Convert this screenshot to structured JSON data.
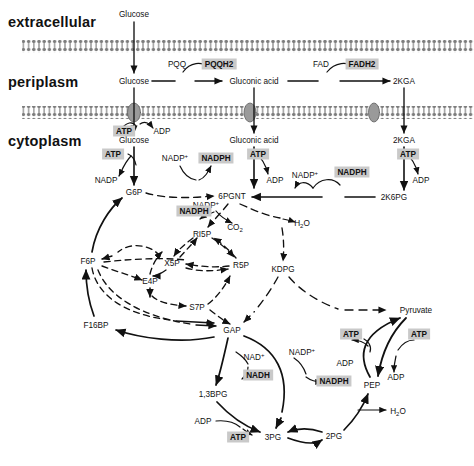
{
  "figure": {
    "type": "biochemical-pathway-diagram",
    "colors": {
      "background": "#ffffff",
      "ink": "#111111",
      "highlight_box": "#c9c9c9",
      "membrane": "#8a8a8a",
      "transporter": "#9a9a9a"
    }
  },
  "compartments": [
    {
      "id": "extracellular",
      "label": "extracellular",
      "x": 8,
      "y": 22
    },
    {
      "id": "periplasm",
      "label": "periplasm",
      "x": 8,
      "y": 82
    },
    {
      "id": "cytoplasm",
      "label": "cytoplasm",
      "x": 8,
      "y": 141
    }
  ],
  "membranes": [
    {
      "id": "outer-membrane",
      "y": 46,
      "label": "outer membrane"
    },
    {
      "id": "inner-membrane",
      "y": 112,
      "label": "inner membrane"
    }
  ],
  "transporters": [
    {
      "id": "glucose-transporter",
      "x": 134,
      "y": 112
    },
    {
      "id": "gluconic-acid-transporter",
      "x": 250,
      "y": 112
    },
    {
      "id": "2kga-transporter",
      "x": 374,
      "y": 112
    }
  ],
  "metabolites": [
    {
      "id": "glucose-extracellular",
      "label": "Glucose",
      "x": 134,
      "y": 14
    },
    {
      "id": "glucose-periplasm",
      "label": "Glucose",
      "x": 134,
      "y": 81
    },
    {
      "id": "gluconic-acid-peri",
      "label": "Gluconic acid",
      "x": 254,
      "y": 81
    },
    {
      "id": "2kga-periplasm",
      "label": "2KGA",
      "x": 404,
      "y": 81
    },
    {
      "id": "glucose-cytoplasm",
      "label": "Glucose",
      "x": 134,
      "y": 140
    },
    {
      "id": "gluconic-acid-cyto",
      "label": "Gluconic acid",
      "x": 254,
      "y": 140
    },
    {
      "id": "2kga-cytoplasm",
      "label": "2KGA",
      "x": 404,
      "y": 140
    },
    {
      "id": "g6p",
      "label": "G6P",
      "x": 134,
      "y": 192
    },
    {
      "id": "6pgnt",
      "label": "6PGNT",
      "x": 232,
      "y": 196
    },
    {
      "id": "2k6pg",
      "label": "2K6PG",
      "x": 394,
      "y": 197
    },
    {
      "id": "co2",
      "label": "CO2",
      "x": 235,
      "y": 228,
      "formula": true
    },
    {
      "id": "h2o-ed",
      "label": "H2O",
      "x": 302,
      "y": 224,
      "formula": true
    },
    {
      "id": "ri5p",
      "label": "RI5P",
      "x": 202,
      "y": 234
    },
    {
      "id": "kdpg",
      "label": "KDPG",
      "x": 283,
      "y": 269
    },
    {
      "id": "f6p",
      "label": "F6P",
      "x": 88,
      "y": 261
    },
    {
      "id": "x5p",
      "label": "X5P",
      "x": 172,
      "y": 263
    },
    {
      "id": "r5p",
      "label": "R5P",
      "x": 241,
      "y": 265
    },
    {
      "id": "e4p",
      "label": "E4P",
      "x": 150,
      "y": 281
    },
    {
      "id": "s7p",
      "label": "S7P",
      "x": 197,
      "y": 307
    },
    {
      "id": "f16bp",
      "label": "F16BP",
      "x": 96,
      "y": 325
    },
    {
      "id": "gap",
      "label": "GAP",
      "x": 232,
      "y": 330
    },
    {
      "id": "pyruvate",
      "label": "Pyruvate",
      "x": 416,
      "y": 310
    },
    {
      "id": "pep",
      "label": "PEP",
      "x": 372,
      "y": 385
    },
    {
      "id": "13bpg",
      "label": "1,3BPG",
      "x": 213,
      "y": 394
    },
    {
      "id": "3pg",
      "label": "3PG",
      "x": 273,
      "y": 437
    },
    {
      "id": "2pg",
      "label": "2PG",
      "x": 334,
      "y": 436
    },
    {
      "id": "h2o-eno",
      "label": "H2O",
      "x": 398,
      "y": 412,
      "formula": true
    }
  ],
  "cofactors_plain": [
    {
      "id": "pqq",
      "label": "PQQ",
      "x": 177,
      "y": 64
    },
    {
      "id": "fad",
      "label": "FAD",
      "x": 321,
      "y": 64
    },
    {
      "id": "adp-glk-pe",
      "label": "ADP",
      "x": 162,
      "y": 131
    },
    {
      "id": "nadp-g6pdh",
      "label": "NADP",
      "x": 175,
      "y": 158,
      "plus": true
    },
    {
      "id": "adp-glk",
      "label": "ADP",
      "x": 106,
      "y": 180
    },
    {
      "id": "adp-gnk",
      "label": "ADP",
      "x": 275,
      "y": 180
    },
    {
      "id": "adp-kgk",
      "label": "ADP",
      "x": 421,
      "y": 180
    },
    {
      "id": "nadp-2k6pg",
      "label": "NADP",
      "x": 305,
      "y": 175,
      "plus": true
    },
    {
      "id": "nadp-6pgdh",
      "label": "NADP",
      "x": 206,
      "y": 205,
      "plus": true
    },
    {
      "id": "nad-gapdh",
      "label": "NAD",
      "x": 254,
      "y": 357,
      "plus": true
    },
    {
      "id": "nadp-gapn",
      "label": "NADP",
      "x": 302,
      "y": 352,
      "plus": true
    },
    {
      "id": "adp-pyk",
      "label": "ADP",
      "x": 345,
      "y": 363
    },
    {
      "id": "adp-pps",
      "label": "ADP",
      "x": 396,
      "y": 377
    },
    {
      "id": "adp-pgk",
      "label": "ADP",
      "x": 203,
      "y": 421
    }
  ],
  "cofactors_highlighted": [
    {
      "id": "pqqh2",
      "label": "PQQH2",
      "x": 219,
      "y": 64
    },
    {
      "id": "fadh2",
      "label": "FADH2",
      "x": 362,
      "y": 64
    },
    {
      "id": "atp-glk-pe",
      "label": "ATP",
      "x": 124,
      "y": 131
    },
    {
      "id": "atp-glk",
      "label": "ATP",
      "x": 113,
      "y": 154
    },
    {
      "id": "nadph-g6pdh",
      "label": "NADPH",
      "x": 216,
      "y": 158
    },
    {
      "id": "atp-gnk",
      "label": "ATP",
      "x": 258,
      "y": 154
    },
    {
      "id": "atp-kgk",
      "label": "ATP",
      "x": 408,
      "y": 154
    },
    {
      "id": "nadph-2k6pg",
      "label": "NADPH",
      "x": 352,
      "y": 172
    },
    {
      "id": "nadph-6pgdh",
      "label": "NADPH",
      "x": 194,
      "y": 211
    },
    {
      "id": "nadh-gapdh",
      "label": "NADH",
      "x": 258,
      "y": 375
    },
    {
      "id": "nadph-gapn",
      "label": "NADPH",
      "x": 334,
      "y": 381
    },
    {
      "id": "atp-pyk",
      "label": "ATP",
      "x": 351,
      "y": 334
    },
    {
      "id": "atp-pps",
      "label": "ATP",
      "x": 419,
      "y": 334
    },
    {
      "id": "atp-pgk",
      "label": "ATP",
      "x": 238,
      "y": 437
    }
  ]
}
